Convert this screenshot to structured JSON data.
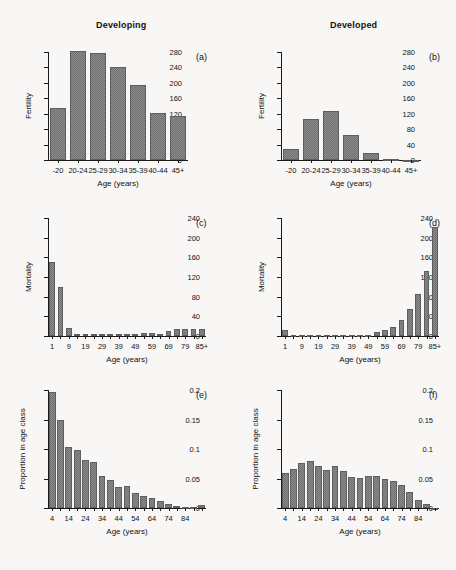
{
  "figure": {
    "column_titles": [
      "Developing",
      "Developed"
    ],
    "panel_labels": [
      "(a)",
      "(b)",
      "(c)",
      "(d)",
      "(e)",
      "(f)"
    ],
    "background_color": "#f8f7f5",
    "bar_color": "#8d8d8d"
  },
  "chart_data": [
    {
      "type": "bar",
      "panel": "(a)",
      "title": "Developing",
      "xlabel": "Age (years)",
      "ylabel": "Fertility",
      "categories": [
        "-20",
        "20-24",
        "25-29",
        "30-34",
        "35-39",
        "40-44",
        "45+"
      ],
      "values": [
        135,
        282,
        277,
        242,
        194,
        122,
        114
      ],
      "ylim": [
        0,
        280
      ],
      "yticks": [
        0,
        40,
        80,
        120,
        160,
        200,
        240,
        280
      ],
      "grid": false,
      "legend": "none"
    },
    {
      "type": "bar",
      "panel": "(b)",
      "title": "Developed",
      "xlabel": "Age (years)",
      "ylabel": "Fertility",
      "categories": [
        "-20",
        "20-24",
        "25-29",
        "30-34",
        "35-39",
        "40-44",
        "45+"
      ],
      "values": [
        28,
        106,
        127,
        65,
        17,
        2,
        0
      ],
      "ylim": [
        0,
        280
      ],
      "yticks": [
        0,
        40,
        80,
        120,
        160,
        200,
        240,
        280
      ],
      "grid": false,
      "legend": "none"
    },
    {
      "type": "bar",
      "panel": "(c)",
      "title": "Developing",
      "xlabel": "Age (years)",
      "ylabel": "Mortality",
      "xticks": [
        "1",
        "9",
        "19",
        "29",
        "39",
        "49",
        "59",
        "69",
        "79",
        "85+"
      ],
      "categories": [
        "1",
        "4",
        "9",
        "14",
        "19",
        "24",
        "29",
        "34",
        "39",
        "44",
        "49",
        "54",
        "59",
        "64",
        "69",
        "74",
        "79",
        "84",
        "85+"
      ],
      "values": [
        151,
        99,
        17,
        5,
        4,
        4,
        4,
        4,
        4,
        4,
        5,
        6,
        6,
        5,
        11,
        15,
        15,
        15,
        15
      ],
      "ylim": [
        0,
        240
      ],
      "yticks": [
        0,
        40,
        80,
        120,
        160,
        200,
        240
      ],
      "grid": false,
      "legend": "none"
    },
    {
      "type": "bar",
      "panel": "(d)",
      "title": "Developed",
      "xlabel": "Age (years)",
      "ylabel": "Mortality",
      "xticks": [
        "1",
        "9",
        "19",
        "29",
        "39",
        "49",
        "59",
        "69",
        "79",
        "85+"
      ],
      "categories": [
        "1",
        "4",
        "9",
        "14",
        "19",
        "24",
        "29",
        "34",
        "39",
        "44",
        "49",
        "54",
        "59",
        "64",
        "69",
        "74",
        "79",
        "84",
        "85+"
      ],
      "values": [
        12,
        1,
        1,
        1,
        2,
        2,
        2,
        2,
        2,
        2,
        3,
        8,
        13,
        19,
        33,
        55,
        86,
        133,
        221
      ],
      "ylim": [
        0,
        240
      ],
      "yticks": [
        0,
        40,
        80,
        120,
        160,
        200,
        240
      ],
      "grid": false,
      "legend": "none"
    },
    {
      "type": "bar",
      "panel": "(e)",
      "title": "Developing",
      "xlabel": "Age (years)",
      "ylabel": "Proportion in age class",
      "xticks": [
        "4",
        "14",
        "24",
        "34",
        "44",
        "54",
        "64",
        "74",
        "84"
      ],
      "categories": [
        "4",
        "9",
        "14",
        "19",
        "24",
        "29",
        "34",
        "39",
        "44",
        "49",
        "54",
        "59",
        "64",
        "69",
        "74",
        "79",
        "84",
        "89",
        "90+"
      ],
      "values": [
        0.197,
        0.15,
        0.104,
        0.098,
        0.082,
        0.078,
        0.054,
        0.047,
        0.035,
        0.038,
        0.025,
        0.021,
        0.017,
        0.012,
        0.007,
        0.004,
        0.002,
        0.002,
        0.005
      ],
      "ylim": [
        0,
        0.2
      ],
      "yticks": [
        0,
        0.05,
        0.1,
        0.15,
        0.2
      ],
      "grid": false,
      "legend": "none"
    },
    {
      "type": "bar",
      "panel": "(f)",
      "title": "Developed",
      "xlabel": "Age (years)",
      "ylabel": "Proportion in age class",
      "xticks": [
        "4",
        "14",
        "24",
        "34",
        "44",
        "54",
        "64",
        "74",
        "84"
      ],
      "categories": [
        "4",
        "9",
        "14",
        "19",
        "24",
        "29",
        "34",
        "39",
        "44",
        "49",
        "54",
        "59",
        "64",
        "69",
        "74",
        "79",
        "84",
        "89",
        "90+"
      ],
      "values": [
        0.059,
        0.066,
        0.077,
        0.08,
        0.071,
        0.065,
        0.071,
        0.062,
        0.053,
        0.051,
        0.054,
        0.054,
        0.049,
        0.046,
        0.039,
        0.027,
        0.014,
        0.006,
        0.0
      ],
      "ylim": [
        0,
        0.2
      ],
      "yticks": [
        0,
        0.05,
        0.1,
        0.15,
        0.2
      ],
      "grid": false,
      "legend": "none"
    }
  ]
}
